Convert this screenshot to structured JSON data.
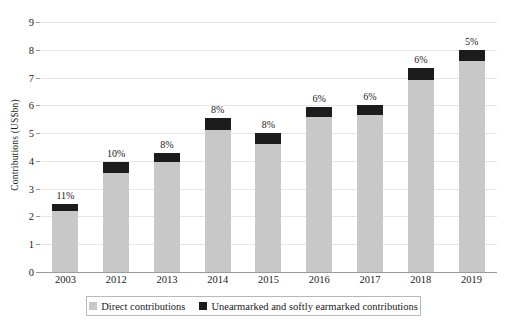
{
  "chart_data": {
    "type": "bar",
    "title": "",
    "subtitle": "",
    "xlabel": "",
    "ylabel": "Contributions (US$bn)",
    "ylim": [
      0,
      9
    ],
    "ytick_values": [
      0,
      1,
      2,
      3,
      4,
      5,
      6,
      7,
      8,
      9
    ],
    "ytick_labels": [
      "0",
      "1",
      "2",
      "3",
      "4",
      "5",
      "6",
      "7",
      "8",
      "9"
    ],
    "grid": true,
    "stacked": true,
    "legend_position": "bottom",
    "categories": [
      "2003",
      "2012",
      "2013",
      "2014",
      "2015",
      "2016",
      "2017",
      "2018",
      "2019"
    ],
    "series": [
      {
        "name": "Direct contributions",
        "color": "#c8c8c8",
        "values": [
          2.18,
          3.56,
          3.96,
          5.11,
          4.6,
          5.59,
          5.64,
          6.91,
          7.6
        ]
      },
      {
        "name": "Unearmarked and softly earmarked contributions",
        "color": "#1c1c1c",
        "values": [
          0.27,
          0.39,
          0.34,
          0.44,
          0.4,
          0.36,
          0.36,
          0.44,
          0.4
        ]
      }
    ],
    "totals": [
      2.45,
      3.95,
      4.3,
      5.55,
      5.0,
      5.95,
      6.0,
      7.35,
      8.0
    ],
    "annotations": [
      "11%",
      "10%",
      "8%",
      "8%",
      "8%",
      "6%",
      "6%",
      "6%",
      "5%"
    ]
  },
  "legend": {
    "items": [
      {
        "label": "Direct contributions",
        "color": "#c8c8c8"
      },
      {
        "label": "Unearmarked and softly earmarked contributions",
        "color": "#1c1c1c"
      }
    ]
  }
}
